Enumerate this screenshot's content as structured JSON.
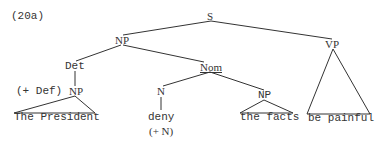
{
  "example_label": "(20a)",
  "nodes": {
    "s": "S",
    "np_subject": "NP",
    "vp": "VP",
    "det": "Det",
    "nom": "Nom",
    "np_det": "NP",
    "n": "N",
    "np_object": "NP"
  },
  "features": {
    "det_feature": "(+ Def)",
    "n_feature": "(+ N)"
  },
  "leaves": {
    "the_president": "The President",
    "deny": "deny",
    "the_facts": "the facts",
    "be_painful": "be painful"
  },
  "colors": {
    "ink": "#333333",
    "background": "#ffffff"
  }
}
